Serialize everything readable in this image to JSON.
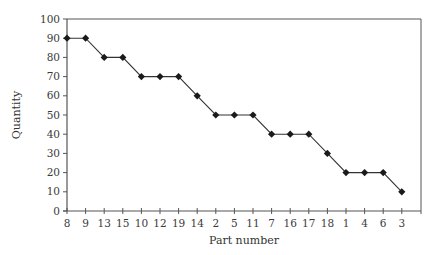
{
  "chart_data": {
    "type": "line",
    "title": "",
    "xlabel": "Part number",
    "ylabel": "Quantity",
    "categories": [
      "8",
      "9",
      "13",
      "15",
      "10",
      "12",
      "19",
      "14",
      "2",
      "5",
      "11",
      "7",
      "16",
      "17",
      "18",
      "1",
      "4",
      "6",
      "3"
    ],
    "series": [
      {
        "name": "Quantity",
        "values": [
          90,
          90,
          80,
          80,
          70,
          70,
          70,
          60,
          50,
          50,
          50,
          40,
          40,
          40,
          30,
          20,
          20,
          20,
          10
        ],
        "marker": "diamond",
        "color": "#222222"
      }
    ],
    "ylim": [
      0,
      100
    ],
    "yticks": [
      0,
      10,
      20,
      30,
      40,
      50,
      60,
      70,
      80,
      90,
      100
    ],
    "grid": false,
    "legend": null
  },
  "colors": {
    "axis": "#555555",
    "line": "#333333",
    "marker": "#1a1a1a"
  }
}
